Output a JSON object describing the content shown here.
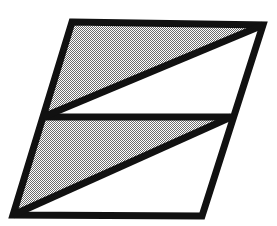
{
  "figure": {
    "title": "Shaded parallelogram divided into four triangles",
    "canvas": {
      "width": 277,
      "height": 226,
      "background_color": "#ffffff"
    },
    "stroke": {
      "color": "#111111",
      "width": 7
    },
    "fill": {
      "shaded_color": "#9a9a9a",
      "shaded_pattern": "checkerboard-dither-50",
      "unshaded_color": "#ffffff"
    },
    "vertices": {
      "top_left": [
        72,
        22
      ],
      "top_right": [
        263,
        25
      ],
      "bottom_right": [
        202,
        216
      ],
      "bottom_left": [
        13,
        215
      ],
      "mid_left": [
        43,
        117
      ],
      "mid_right": [
        231,
        117
      ]
    },
    "outline_points": "72,22 263,25 202,216 13,215",
    "regions": [
      {
        "name": "upper-left-triangle",
        "shaded": true,
        "points": "72,22 263,25 43,117"
      },
      {
        "name": "upper-right-triangle",
        "shaded": false,
        "points": "263,25 231,117 43,117"
      },
      {
        "name": "lower-left-triangle",
        "shaded": true,
        "points": "43,117 231,117 13,215"
      },
      {
        "name": "lower-right-triangle",
        "shaded": false,
        "points": "231,117 202,216 13,215"
      }
    ],
    "lines": [
      {
        "name": "edge-top",
        "from": [
          72,
          22
        ],
        "to": [
          263,
          25
        ]
      },
      {
        "name": "edge-right",
        "from": [
          263,
          25
        ],
        "to": [
          202,
          216
        ]
      },
      {
        "name": "edge-bottom",
        "from": [
          202,
          216
        ],
        "to": [
          13,
          215
        ]
      },
      {
        "name": "edge-left",
        "from": [
          13,
          215
        ],
        "to": [
          72,
          22
        ]
      },
      {
        "name": "divider-horizontal",
        "from": [
          43,
          117
        ],
        "to": [
          231,
          117
        ]
      },
      {
        "name": "diagonal-upper",
        "from": [
          43,
          117
        ],
        "to": [
          263,
          25
        ]
      },
      {
        "name": "diagonal-lower",
        "from": [
          13,
          215
        ],
        "to": [
          231,
          117
        ]
      }
    ]
  }
}
